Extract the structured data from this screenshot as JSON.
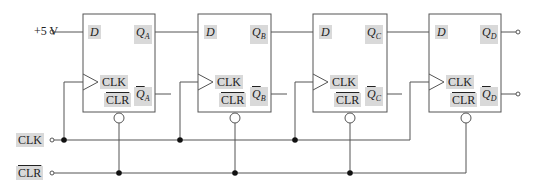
{
  "diagram": {
    "type": "4-bit serial-in shift register with D flip-flops",
    "input": {
      "label": "+5 V"
    },
    "control_inputs": [
      {
        "label": "CLK",
        "overbar": false
      },
      {
        "label": "CLR",
        "overbar": true
      }
    ],
    "flip_flops": [
      {
        "name": "A",
        "d_label": "D",
        "q_label": "Q",
        "q_sub": "A",
        "clk_label": "CLK",
        "clr_label": "CLR"
      },
      {
        "name": "B",
        "d_label": "D",
        "q_label": "Q",
        "q_sub": "B",
        "clk_label": "CLK",
        "clr_label": "CLR"
      },
      {
        "name": "C",
        "d_label": "D",
        "q_label": "Q",
        "q_sub": "C",
        "clk_label": "CLK",
        "clr_label": "CLR"
      },
      {
        "name": "D",
        "d_label": "D",
        "q_label": "Q",
        "q_sub": "D",
        "clk_label": "CLK",
        "clr_label": "CLR"
      }
    ],
    "colors": {
      "line": "#555555",
      "label_bg": "#d9d9d9",
      "text": "#222222"
    }
  }
}
